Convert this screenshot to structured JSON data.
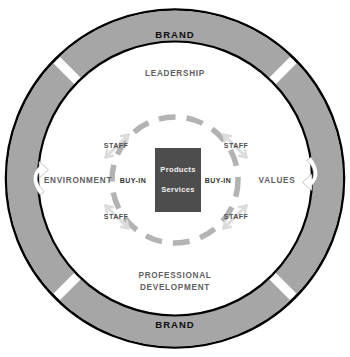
{
  "diagram": {
    "type": "concentric-circle-model",
    "colors": {
      "outer_ring_fill": "#a6a6a6",
      "outer_ring_stroke": "#000000",
      "middle_ring_fill": "#ffffff",
      "dashed_circle": "#b3b3b3",
      "core_fill": "#4d4d4d",
      "core_text": "#f2f2f2",
      "ring_label_text": "#5f6061",
      "brand_text": "#0d0d0d",
      "arrow_fill": "#ffffff",
      "staff_arrow": "#d9d9d9"
    },
    "outer_ring": {
      "name": "brand-ring",
      "labels": [
        {
          "id": "brand-top",
          "text": "BRAND",
          "x": 175,
          "y": 35
        },
        {
          "id": "brand-bottom",
          "text": "BRAND",
          "x": 175,
          "y": 325
        }
      ],
      "arrows": [
        {
          "id": "rotate-up-arrow",
          "icon": "curved-arrow-up-icon",
          "x": 38,
          "y": 176
        },
        {
          "id": "rotate-down-arrow",
          "icon": "curved-arrow-down-icon",
          "x": 313,
          "y": 176
        }
      ],
      "gap_angles_deg": [
        45,
        135,
        225,
        315
      ]
    },
    "middle_ring": {
      "name": "pillars-ring",
      "labels": [
        {
          "id": "leadership",
          "text": "LEADERSHIP",
          "x": 175,
          "y": 74,
          "lines": [
            "LEADERSHIP"
          ]
        },
        {
          "id": "environment",
          "text": "ENVIRONMENT",
          "x": 78,
          "y": 181,
          "lines": [
            "ENVIRONMENT"
          ]
        },
        {
          "id": "values",
          "text": "VALUES",
          "x": 277,
          "y": 181,
          "lines": [
            "VALUES"
          ]
        },
        {
          "id": "professional-development",
          "text": "PROFESSIONAL DEVELOPMENT",
          "x": 175,
          "y": 282,
          "lines": [
            "PROFESSIONAL",
            "DEVELOPMENT"
          ]
        }
      ]
    },
    "inner_ring": {
      "name": "staff-buyin-ring",
      "staff_labels": [
        {
          "id": "staff-top-left",
          "text": "STAFF",
          "x": 116,
          "y": 146
        },
        {
          "id": "staff-top-right",
          "text": "STAFF",
          "x": 236,
          "y": 146
        },
        {
          "id": "staff-bottom-left",
          "text": "STAFF",
          "x": 116,
          "y": 217
        },
        {
          "id": "staff-bottom-right",
          "text": "STAFF",
          "x": 236,
          "y": 217
        }
      ],
      "buyin_labels": [
        {
          "id": "buyin-left",
          "text": "BUY-IN",
          "x": 133,
          "y": 181
        },
        {
          "id": "buyin-right",
          "text": "BUY-IN",
          "x": 218,
          "y": 181
        }
      ]
    },
    "core": {
      "name": "products-services-core",
      "lines": [
        "Products",
        "Services"
      ],
      "line1": "Products",
      "line2": "Services",
      "rect": {
        "x": 155,
        "y": 148,
        "width": 46,
        "height": 64
      }
    }
  }
}
